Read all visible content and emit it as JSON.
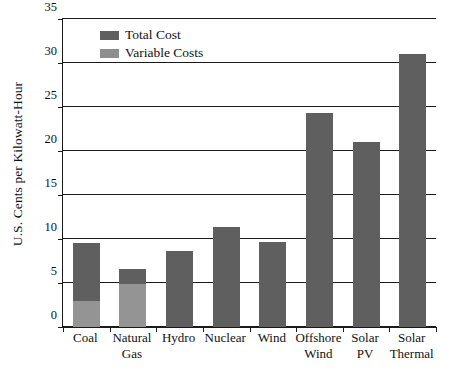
{
  "chart_data": {
    "type": "bar",
    "title": "",
    "xlabel": "",
    "ylabel": "U.S. Cents per Kilowatt-Hour",
    "ylim": [
      0,
      35
    ],
    "yticks": [
      0,
      5,
      10,
      15,
      20,
      25,
      30,
      35
    ],
    "ytick_labels": [
      "0",
      "5",
      "10",
      "15",
      "20",
      "25",
      "30",
      "35"
    ],
    "grid": true,
    "legend_position": "top-left",
    "categories": [
      "Coal",
      "Natural Gas",
      "Hydro",
      "Nuclear",
      "Wind",
      "Offshore Wind",
      "Solar PV",
      "Solar Thermal"
    ],
    "category_lines": [
      [
        "Coal",
        ""
      ],
      [
        "Natural",
        "Gas"
      ],
      [
        "Hydro",
        ""
      ],
      [
        "Nuclear",
        ""
      ],
      [
        "Wind",
        ""
      ],
      [
        "Offshore",
        "Wind"
      ],
      [
        "Solar",
        "PV"
      ],
      [
        "Solar",
        "Thermal"
      ]
    ],
    "series": [
      {
        "name": "Total Cost",
        "color": "#5f5f5f",
        "values": [
          9.5,
          6.6,
          8.6,
          11.4,
          9.7,
          24.3,
          21.0,
          31.0
        ]
      },
      {
        "name": "Variable Costs",
        "color": "#949494",
        "values": [
          2.9,
          4.9,
          0,
          0,
          0,
          0,
          0,
          0
        ]
      }
    ]
  },
  "legend": {
    "items": [
      {
        "label": "Total Cost",
        "swatch": "total"
      },
      {
        "label": "Variable Costs",
        "swatch": "variable"
      }
    ]
  },
  "axes": {
    "y_title": "U.S. Cents per Kilowatt-Hour"
  }
}
